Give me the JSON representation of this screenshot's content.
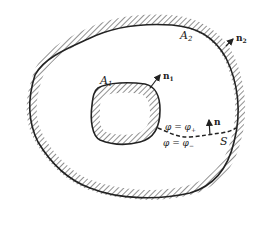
{
  "diagram": {
    "colors": {
      "ink": "#222222",
      "background": "#ffffff"
    },
    "labels": {
      "inner_boundary": "A",
      "inner_boundary_sub": "1",
      "outer_boundary": "A",
      "outer_boundary_sub": "2",
      "inner_normal": "n",
      "inner_normal_sub": "1",
      "outer_normal": "n",
      "outer_normal_sub": "2",
      "cut_normal": "n",
      "cut_surface": "S",
      "phi_plus": "φ = φ",
      "phi_plus_sub": "+",
      "phi_minus": "φ = φ",
      "phi_minus_sub": "−"
    }
  }
}
